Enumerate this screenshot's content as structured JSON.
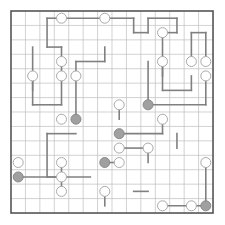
{
  "puzzle": {
    "type": "masyu-loop-grid",
    "title": "Masyu puzzle with solution loop",
    "grid": {
      "cols": 14,
      "rows": 14,
      "origin_x": 11,
      "origin_y": 11,
      "cell": 14.43,
      "grid_line_color": "#bfbfbf",
      "border_color": "#555555",
      "border_width": 1.6,
      "grid_line_width": 0.7,
      "background": "#ffffff"
    },
    "path": {
      "color": "#808080",
      "width": 1.6,
      "label": "solution-loop"
    },
    "circles": {
      "white_fill": "#ffffff",
      "white_stroke": "#aaaaaa",
      "gray_fill": "#a0a0a0",
      "gray_stroke": "#8a8a8a",
      "radius": 5.0,
      "stroke_width": 1.0,
      "white_label": "white-circle",
      "gray_label": "gray-circle",
      "white": [
        [
          3,
          0
        ],
        [
          6,
          0
        ],
        [
          3,
          3
        ],
        [
          10,
          1
        ],
        [
          3,
          4
        ],
        [
          1,
          4
        ],
        [
          4,
          4
        ],
        [
          10,
          3
        ],
        [
          12,
          3
        ],
        [
          13,
          3
        ],
        [
          13,
          4
        ],
        [
          7,
          6
        ],
        [
          3,
          7
        ],
        [
          7,
          8
        ],
        [
          10,
          7
        ],
        [
          7,
          9
        ],
        [
          9,
          9
        ],
        [
          6,
          10
        ],
        [
          7,
          10
        ],
        [
          3,
          10
        ],
        [
          3,
          11
        ],
        [
          0,
          10
        ],
        [
          13,
          10
        ],
        [
          6,
          12
        ],
        [
          3,
          12
        ],
        [
          10,
          13
        ],
        [
          12,
          13
        ]
      ],
      "gray": [
        [
          9,
          6
        ],
        [
          4,
          7
        ],
        [
          7,
          8
        ],
        [
          6,
          10
        ],
        [
          0,
          11
        ],
        [
          13,
          13
        ]
      ],
      "gray_fixed": [
        [
          9,
          6
        ],
        [
          4,
          7
        ],
        [
          7,
          8
        ],
        [
          6,
          10
        ],
        [
          0,
          11
        ],
        [
          13,
          13
        ]
      ]
    },
    "segments": [
      [
        [
          3,
          0
        ],
        [
          6,
          0
        ]
      ],
      [
        [
          2,
          0
        ],
        [
          3,
          0
        ]
      ],
      [
        [
          2,
          0
        ],
        [
          2,
          2
        ]
      ],
      [
        [
          2,
          2
        ],
        [
          3,
          2
        ]
      ],
      [
        [
          3,
          2
        ],
        [
          3,
          4
        ]
      ],
      [
        [
          6,
          0
        ],
        [
          8,
          0
        ]
      ],
      [
        [
          8,
          0
        ],
        [
          8,
          1
        ]
      ],
      [
        [
          8,
          1
        ],
        [
          9,
          1
        ]
      ],
      [
        [
          9,
          1
        ],
        [
          9,
          0
        ]
      ],
      [
        [
          9,
          0
        ],
        [
          11,
          0
        ]
      ],
      [
        [
          11,
          0
        ],
        [
          11,
          1
        ]
      ],
      [
        [
          11,
          1
        ],
        [
          10,
          1
        ]
      ],
      [
        [
          10,
          1
        ],
        [
          10,
          4
        ]
      ],
      [
        [
          13,
          1
        ],
        [
          13,
          3
        ]
      ],
      [
        [
          12,
          1
        ],
        [
          13,
          1
        ]
      ],
      [
        [
          12,
          1
        ],
        [
          12,
          3
        ]
      ],
      [
        [
          1,
          2
        ],
        [
          1,
          6
        ]
      ],
      [
        [
          1,
          6
        ],
        [
          3,
          6
        ]
      ],
      [
        [
          3,
          6
        ],
        [
          3,
          4
        ]
      ],
      [
        [
          1,
          4
        ],
        [
          1,
          5
        ]
      ],
      [
        [
          4,
          3
        ],
        [
          4,
          7
        ]
      ],
      [
        [
          4,
          3
        ],
        [
          6,
          3
        ]
      ],
      [
        [
          6,
          3
        ],
        [
          6,
          2
        ]
      ],
      [
        [
          9,
          3
        ],
        [
          9,
          6
        ]
      ],
      [
        [
          10,
          3
        ],
        [
          10,
          5
        ]
      ],
      [
        [
          10,
          5
        ],
        [
          12,
          5
        ]
      ],
      [
        [
          12,
          5
        ],
        [
          12,
          4
        ]
      ],
      [
        [
          13,
          4
        ],
        [
          13,
          6
        ]
      ],
      [
        [
          7,
          6
        ],
        [
          7,
          7
        ]
      ],
      [
        [
          9,
          6
        ],
        [
          13,
          6
        ]
      ],
      [
        [
          2,
          8
        ],
        [
          2,
          11
        ]
      ],
      [
        [
          2,
          8
        ],
        [
          4,
          8
        ]
      ],
      [
        [
          7,
          8
        ],
        [
          10,
          8
        ]
      ],
      [
        [
          10,
          8
        ],
        [
          10,
          7
        ]
      ],
      [
        [
          11,
          8
        ],
        [
          11,
          9
        ]
      ],
      [
        [
          7,
          9
        ],
        [
          9,
          9
        ]
      ],
      [
        [
          9,
          9
        ],
        [
          9,
          10
        ]
      ],
      [
        [
          6,
          10
        ],
        [
          7,
          10
        ]
      ],
      [
        [
          2,
          11
        ],
        [
          5,
          11
        ]
      ],
      [
        [
          3,
          10
        ],
        [
          3,
          12
        ]
      ],
      [
        [
          0,
          11
        ],
        [
          3,
          11
        ]
      ],
      [
        [
          6,
          12
        ],
        [
          6,
          13
        ]
      ],
      [
        [
          8,
          12
        ],
        [
          9,
          12
        ]
      ],
      [
        [
          10,
          13
        ],
        [
          13,
          13
        ]
      ],
      [
        [
          13,
          10
        ],
        [
          13,
          13
        ]
      ]
    ]
  }
}
